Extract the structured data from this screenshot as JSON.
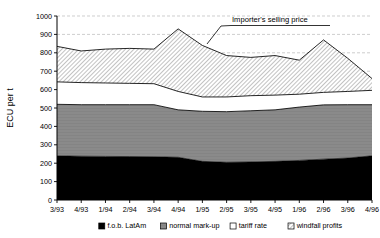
{
  "chart_data": {
    "type": "area",
    "stacked": true,
    "title": "",
    "xlabel": "",
    "ylabel": "ECU per t",
    "ylim": [
      0,
      1000
    ],
    "ytick_step": 100,
    "yticks": [
      0,
      100,
      200,
      300,
      400,
      500,
      600,
      700,
      800,
      900,
      1000
    ],
    "ytick_labels": [
      "0",
      "100",
      "200",
      "300",
      "400",
      "500",
      "600",
      "700",
      "800",
      "900",
      "1000"
    ],
    "grid": "horizontal-dashed",
    "legend_position": "bottom",
    "categories": [
      "3/93",
      "4/93",
      "1/94",
      "2/94",
      "3/94",
      "4/94",
      "1/95",
      "2/95",
      "3/95",
      "4/95",
      "1/96",
      "2/96",
      "3/96",
      "4/96"
    ],
    "series": [
      {
        "name": "f.o.b. LatAm",
        "fill": "#000000",
        "pattern": "solid-black",
        "values": [
          240,
          238,
          237,
          236,
          235,
          232,
          210,
          205,
          207,
          210,
          215,
          222,
          228,
          240
        ]
      },
      {
        "name": "normal mark-up",
        "fill": "#808080",
        "pattern": "solid-gray",
        "values": [
          280,
          280,
          281,
          282,
          283,
          258,
          272,
          275,
          278,
          280,
          290,
          295,
          290,
          278
        ]
      },
      {
        "name": "tariff rate",
        "fill": "#ffffff",
        "pattern": "solid-white",
        "values": [
          122,
          120,
          118,
          116,
          114,
          100,
          78,
          80,
          82,
          80,
          70,
          68,
          72,
          78
        ]
      },
      {
        "name": "windfall profits",
        "fill": "#e8e8e8",
        "pattern": "diagonal-hatch",
        "values": [
          193,
          172,
          184,
          190,
          188,
          340,
          280,
          225,
          208,
          215,
          185,
          285,
          180,
          64
        ]
      }
    ],
    "cumulative_top": {
      "name": "Importer's selling price",
      "values": [
        835,
        810,
        820,
        824,
        820,
        930,
        840,
        785,
        775,
        785,
        760,
        870,
        770,
        660
      ]
    },
    "annotations": [
      {
        "text": "Importer's selling price",
        "x_category": "3/94",
        "points_to": "top-line"
      }
    ]
  },
  "legend": {
    "items": [
      {
        "label": "f.o.b. LatAm",
        "swatch": "solid-black"
      },
      {
        "label": "normal mark-up",
        "swatch": "solid-gray"
      },
      {
        "label": "tariff rate",
        "swatch": "solid-white"
      },
      {
        "label": "windfall profits",
        "swatch": "diagonal-hatch"
      }
    ]
  }
}
